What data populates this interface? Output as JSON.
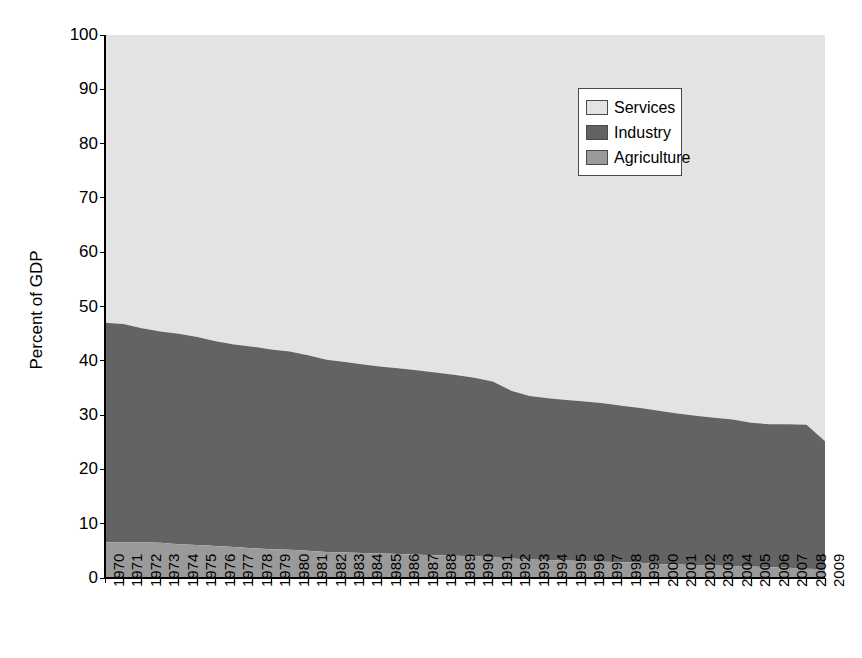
{
  "chart_data": {
    "type": "area",
    "title": "",
    "subtitle": "",
    "xlabel": "",
    "ylabel": "Percent of GDP",
    "ylim": [
      0,
      100
    ],
    "yticks": [
      0,
      10,
      20,
      30,
      40,
      50,
      60,
      70,
      80,
      90,
      100
    ],
    "grid": false,
    "stacked": true,
    "legend_position": "top-right",
    "legend_entries": [
      "Services",
      "Industry",
      "Agriculture"
    ],
    "categories": [
      "1970",
      "1971",
      "1972",
      "1973",
      "1974",
      "1975",
      "1976",
      "1977",
      "1978",
      "1979",
      "1980",
      "1981",
      "1982",
      "1983",
      "1984",
      "1985",
      "1986",
      "1987",
      "1988",
      "1989",
      "1990",
      "1991",
      "1992",
      "1993",
      "1994",
      "1995",
      "1996",
      "1997",
      "1998",
      "1999",
      "2000",
      "2001",
      "2002",
      "2003",
      "2004",
      "2005",
      "2006",
      "2007",
      "2008",
      "2009"
    ],
    "series": [
      {
        "name": "Agriculture",
        "color": "#9a9a9a",
        "values": [
          6.6,
          6.6,
          6.6,
          6.5,
          6.2,
          6.1,
          5.9,
          5.7,
          5.5,
          5.3,
          5.2,
          5.0,
          4.8,
          4.7,
          4.6,
          4.5,
          4.4,
          4.3,
          4.2,
          4.1,
          4.0,
          3.8,
          3.6,
          3.4,
          3.3,
          3.2,
          3.1,
          3.0,
          2.9,
          2.8,
          2.6,
          2.5,
          2.4,
          2.3,
          2.2,
          2.1,
          2.0,
          1.9,
          1.7,
          1.6
        ]
      },
      {
        "name": "Industry",
        "color": "#636363",
        "values": [
          40.4,
          40.2,
          39.4,
          38.9,
          38.8,
          38.3,
          37.7,
          37.3,
          37.1,
          36.8,
          36.5,
          36.0,
          35.4,
          35.1,
          34.7,
          34.4,
          34.2,
          33.9,
          33.6,
          33.3,
          32.9,
          32.4,
          30.9,
          30.1,
          29.8,
          29.6,
          29.4,
          29.2,
          28.8,
          28.5,
          28.2,
          27.8,
          27.5,
          27.2,
          27.0,
          26.5,
          26.3,
          26.4,
          26.5,
          23.6
        ]
      },
      {
        "name": "Services",
        "color": "#e3e3e3",
        "values": [
          53.0,
          53.2,
          54.0,
          54.6,
          55.0,
          55.6,
          56.4,
          57.0,
          57.4,
          57.9,
          58.3,
          59.0,
          59.8,
          60.2,
          60.7,
          61.1,
          61.4,
          61.8,
          62.2,
          62.6,
          63.1,
          63.8,
          65.5,
          66.5,
          66.9,
          67.2,
          67.5,
          67.8,
          68.3,
          68.7,
          69.2,
          69.7,
          70.1,
          70.5,
          70.8,
          71.4,
          71.7,
          71.7,
          71.8,
          74.8
        ]
      }
    ],
    "stack_top_agriculture": [
      6.6,
      6.6,
      6.6,
      6.5,
      6.2,
      6.1,
      5.9,
      5.7,
      5.5,
      5.3,
      5.2,
      5.0,
      4.8,
      4.7,
      4.6,
      4.5,
      4.4,
      4.3,
      4.2,
      4.1,
      4.0,
      3.8,
      3.6,
      3.4,
      3.3,
      3.2,
      3.1,
      3.0,
      2.9,
      2.8,
      2.6,
      2.5,
      2.4,
      2.3,
      2.2,
      2.1,
      2.0,
      1.9,
      1.7,
      1.6
    ],
    "stack_top_industry": [
      47.0,
      46.8,
      46.0,
      45.4,
      45.0,
      44.4,
      43.6,
      43.0,
      42.6,
      42.1,
      41.7,
      41.0,
      40.2,
      39.8,
      39.3,
      38.9,
      38.6,
      38.2,
      37.8,
      37.4,
      36.9,
      36.2,
      34.5,
      33.5,
      33.1,
      32.8,
      32.5,
      32.2,
      31.7,
      31.3,
      30.8,
      30.3,
      29.9,
      29.5,
      29.2,
      28.6,
      28.3,
      28.3,
      28.2,
      25.2
    ]
  },
  "legend": {
    "items": [
      {
        "label": "Services",
        "color": "#e3e3e3"
      },
      {
        "label": "Industry",
        "color": "#636363"
      },
      {
        "label": "Agriculture",
        "color": "#9a9a9a"
      }
    ]
  },
  "axes": {
    "y_title": "Percent of GDP"
  }
}
